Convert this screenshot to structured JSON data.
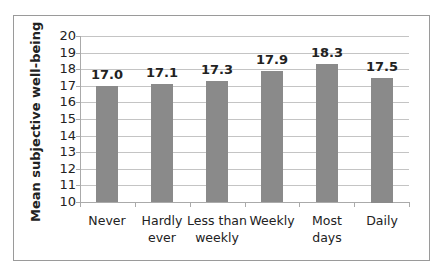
{
  "chart_data": {
    "type": "bar",
    "title": "",
    "xlabel": "",
    "ylabel": "Mean subjective well-being",
    "ylim": [
      10,
      20
    ],
    "yticks": [
      "10",
      "11",
      "12",
      "13",
      "14",
      "15",
      "16",
      "17",
      "18",
      "19",
      "20"
    ],
    "grid": true,
    "legend": null,
    "categories": [
      "Never",
      "Hardly ever",
      "Less than weekly",
      "Weekly",
      "Most days",
      "Daily"
    ],
    "category_lines": [
      [
        "Never"
      ],
      [
        "Hardly",
        "ever"
      ],
      [
        "Less than",
        "weekly"
      ],
      [
        "Weekly"
      ],
      [
        "Most",
        "days"
      ],
      [
        "Daily"
      ]
    ],
    "values": [
      17.0,
      17.1,
      17.3,
      17.9,
      18.3,
      17.5
    ],
    "value_labels": [
      "17.0",
      "17.1",
      "17.3",
      "17.9",
      "18.3",
      "17.5"
    ],
    "colors": {
      "bar": "#8a8a8a",
      "grid": "#c4c4c4",
      "frame": "#9a9a9a"
    }
  }
}
